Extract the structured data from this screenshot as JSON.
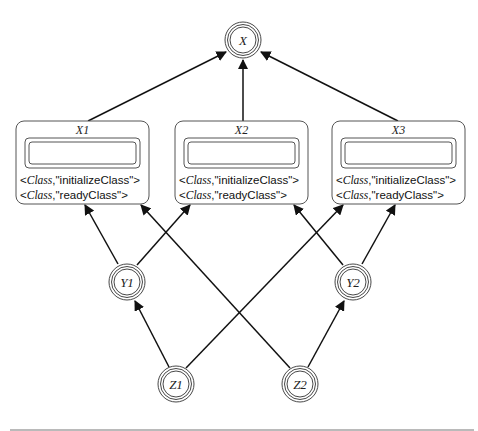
{
  "diagram": {
    "nodes": {
      "X": {
        "label": "X",
        "cx": 243,
        "cy": 40
      },
      "Y1": {
        "label": "Y1",
        "cx": 127,
        "cy": 282
      },
      "Y2": {
        "label": "Y2",
        "cx": 353,
        "cy": 282
      },
      "Z1": {
        "label": "Z1",
        "cx": 176,
        "cy": 384
      },
      "Z2": {
        "label": "Z2",
        "cx": 300,
        "cy": 384
      }
    },
    "boxes": [
      {
        "title": "X1",
        "attr1_class": "Class",
        "attr1_value": ",\"initializeClass\">",
        "attr2_class": "Class",
        "attr2_value": ",\"readyClass\">"
      },
      {
        "title": "X2",
        "attr1_class": "Class",
        "attr1_value": ",\"initializeClass\">",
        "attr2_class": "Class",
        "attr2_value": ",\"readyClass\">"
      },
      {
        "title": "X3",
        "attr1_class": "Class",
        "attr1_value": ",\"initializeClass\">",
        "attr2_class": "Class",
        "attr2_value": ",\"readyClass\">"
      }
    ],
    "open_bracket": "<",
    "edges": [
      {
        "from": "X1",
        "to": "X"
      },
      {
        "from": "X2",
        "to": "X"
      },
      {
        "from": "X3",
        "to": "X"
      },
      {
        "from": "Y1",
        "to": "X1"
      },
      {
        "from": "Y1",
        "to": "X2"
      },
      {
        "from": "Y2",
        "to": "X2"
      },
      {
        "from": "Y2",
        "to": "X3"
      },
      {
        "from": "Z1",
        "to": "Y1"
      },
      {
        "from": "Z1",
        "to": "X3"
      },
      {
        "from": "Z2",
        "to": "Y2"
      },
      {
        "from": "Z2",
        "to": "X1"
      }
    ]
  }
}
